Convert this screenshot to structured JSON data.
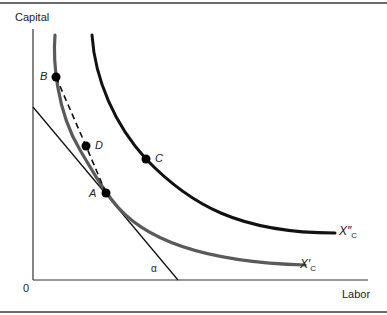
{
  "figure": {
    "y_axis_label": "Capital",
    "x_axis_label": "Labor",
    "origin_label": "0",
    "angle_label": "α",
    "curves": [
      {
        "id": "inner",
        "label_base": "X",
        "label_prime": "′",
        "label_sub": "C",
        "color": "#555555"
      },
      {
        "id": "outer",
        "label_base": "X",
        "label_prime": "″",
        "label_sub": "C",
        "color": "#111111"
      }
    ],
    "points": [
      {
        "label": "B"
      },
      {
        "label": "D"
      },
      {
        "label": "C"
      },
      {
        "label": "A"
      }
    ],
    "lines": {
      "tangent": "budget/isocost line tangent to X'C at A",
      "dashed": "chord from B through D to A"
    }
  }
}
